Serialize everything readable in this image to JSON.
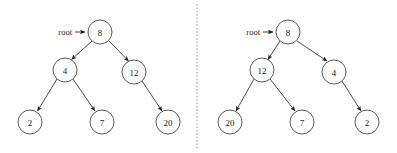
{
  "figure": {
    "background_color": "#fefefe",
    "stroke_color": "#2b2b2b",
    "node_fill_color": "#fdfdfd",
    "node_stroke_color": "#4a4a4a",
    "divider_color": "#9a9a9a",
    "width": 397,
    "height": 153
  },
  "diagram_data": {
    "type": "binary-tree-pair",
    "description": "Two binary trees side by side separated by a vertical dashed divider, each labelled with a root pointer",
    "divider": {
      "orientation": "vertical",
      "x": 197,
      "style": "dashed"
    },
    "panels": [
      {
        "id": "left-tree",
        "root_label": "root",
        "root_label_position": {
          "x": 72,
          "y": 32
        },
        "arrow": {
          "x1": 74,
          "y1": 32,
          "x2": 86,
          "y2": 32
        },
        "nodes": [
          {
            "id": "L8",
            "value": "8",
            "cx": 100,
            "cy": 32,
            "r": 12
          },
          {
            "id": "L4",
            "value": "4",
            "cx": 65,
            "cy": 70,
            "r": 12
          },
          {
            "id": "L12",
            "value": "12",
            "cx": 134,
            "cy": 72,
            "r": 12
          },
          {
            "id": "L2",
            "value": "2",
            "cx": 30,
            "cy": 122,
            "r": 12
          },
          {
            "id": "L7",
            "value": "7",
            "cx": 102,
            "cy": 122,
            "r": 12
          },
          {
            "id": "L20",
            "value": "20",
            "cx": 168,
            "cy": 122,
            "r": 12
          }
        ],
        "edges": [
          {
            "from": "L8",
            "to": "L4"
          },
          {
            "from": "L8",
            "to": "L12"
          },
          {
            "from": "L4",
            "to": "L2"
          },
          {
            "from": "L4",
            "to": "L7"
          },
          {
            "from": "L12",
            "to": "L20"
          }
        ]
      },
      {
        "id": "right-tree",
        "root_label": "root",
        "root_label_position": {
          "x": 260,
          "y": 32
        },
        "arrow": {
          "x1": 262,
          "y1": 32,
          "x2": 274,
          "y2": 32
        },
        "nodes": [
          {
            "id": "R8",
            "value": "8",
            "cx": 288,
            "cy": 32,
            "r": 12
          },
          {
            "id": "R12",
            "value": "12",
            "cx": 262,
            "cy": 70,
            "r": 12
          },
          {
            "id": "R4",
            "value": "4",
            "cx": 334,
            "cy": 72,
            "r": 12
          },
          {
            "id": "R20",
            "value": "20",
            "cx": 230,
            "cy": 122,
            "r": 12
          },
          {
            "id": "R7",
            "value": "7",
            "cx": 302,
            "cy": 122,
            "r": 12
          },
          {
            "id": "R2",
            "value": "2",
            "cx": 367,
            "cy": 122,
            "r": 12
          }
        ],
        "edges": [
          {
            "from": "R8",
            "to": "R12"
          },
          {
            "from": "R8",
            "to": "R4"
          },
          {
            "from": "R12",
            "to": "R20"
          },
          {
            "from": "R12",
            "to": "R7"
          },
          {
            "from": "R4",
            "to": "R2"
          }
        ]
      }
    ]
  },
  "left_panel": {
    "root_label": "root",
    "nodes": {
      "root_value": "8",
      "left_child": "4",
      "right_child": "12",
      "left_left": "2",
      "left_right": "7",
      "right_right": "20"
    }
  },
  "right_panel": {
    "root_label": "root",
    "nodes": {
      "root_value": "8",
      "left_child": "12",
      "right_child": "4",
      "left_left": "20",
      "left_right": "7",
      "right_right": "2"
    }
  }
}
